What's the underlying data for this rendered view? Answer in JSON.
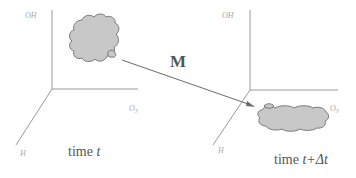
{
  "diagram": {
    "transform_label": "M",
    "left_panel": {
      "axis_vertical_label": "OH",
      "axis_horizontal_label": "O",
      "axis_horizontal_subscript": "3",
      "axis_depth_label": "H",
      "time_prefix": "time ",
      "time_value": "t"
    },
    "right_panel": {
      "axis_vertical_label": "OH",
      "axis_horizontal_label": "O",
      "axis_horizontal_subscript": "3",
      "axis_depth_label": "H",
      "time_prefix": "time ",
      "time_value": "t+Δt"
    }
  },
  "colors": {
    "axis": "#9a9a9a",
    "cloud_fill": "#c8c8c8",
    "cloud_stroke": "#7a7a7a",
    "text": "#555555",
    "axis_label": "#a8a8a8"
  }
}
